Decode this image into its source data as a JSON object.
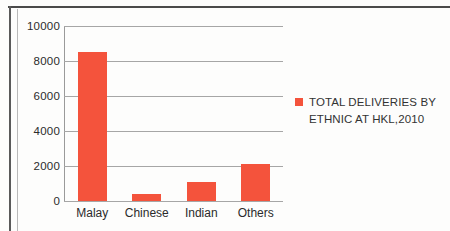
{
  "chart_data": {
    "type": "bar",
    "title": "",
    "xlabel": "",
    "ylabel": "",
    "categories": [
      "Malay",
      "Chinese",
      "Indian",
      "Others"
    ],
    "values": [
      8500,
      400,
      1100,
      2100
    ],
    "series": [
      {
        "name": "TOTAL DELIVERIES BY ETHNIC AT HKL,2010",
        "values": [
          8500,
          400,
          1100,
          2100
        ],
        "color": "#F4533C"
      }
    ],
    "ylim": [
      0,
      10000
    ],
    "y_ticks": [
      "0",
      "2000",
      "4000",
      "6000",
      "8000",
      "10000"
    ],
    "grid": "horizontal",
    "legend_position": "right"
  },
  "legend": {
    "line1": "TOTAL DELIVERIES BY",
    "line2": "ETHNIC AT HKL,2010"
  },
  "colors": {
    "bar": "#F4533C",
    "gridline": "#A6A6A6",
    "axis": "#9A9A9A",
    "text": "#2B2B2B"
  }
}
